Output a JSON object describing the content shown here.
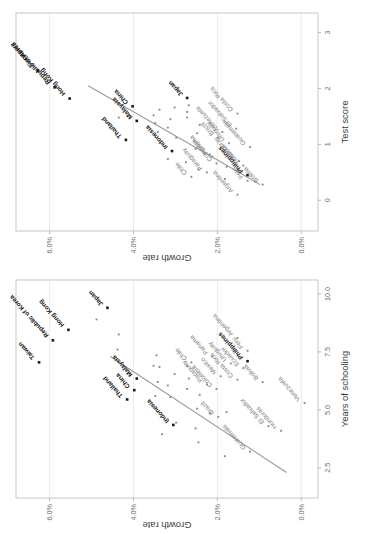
{
  "figure": {
    "orientation": "rotated-90-ccw",
    "panel_count": 2
  },
  "chart_data": [
    {
      "id": "schooling",
      "type": "scatter",
      "title": "",
      "xlabel": "Years of schooling",
      "ylabel": "Growth rate",
      "xlim": [
        1.2,
        10.6
      ],
      "ylim": [
        -0.004,
        0.068
      ],
      "xticks": [
        2.5,
        5.0,
        7.5,
        10.0
      ],
      "xticklabels": [
        "2.5",
        "5.0",
        "7.5",
        "10.0"
      ],
      "yticks": [
        0.0,
        0.02,
        0.04,
        0.06
      ],
      "yticklabels": [
        "0.0%",
        "2.0%",
        "4.0%",
        "6.0%"
      ],
      "grid": true,
      "legend": "none",
      "trendline": {
        "x1": 2.3,
        "y1": 0.0035,
        "x2": 7.3,
        "y2": 0.0455
      },
      "points": [
        {
          "label": "Taiwan",
          "x": 7.05,
          "y": 0.0625,
          "style": "dark",
          "lx": 5,
          "ly": -4
        },
        {
          "label": "Republic of Korea",
          "x": 8.0,
          "y": 0.0592,
          "style": "dark",
          "lx": 5,
          "ly": -4
        },
        {
          "label": "Hong Kong",
          "x": 8.45,
          "y": 0.0555,
          "style": "dark",
          "lx": 5,
          "ly": -4
        },
        {
          "label": "Japan",
          "x": 9.4,
          "y": 0.0462,
          "style": "dark",
          "lx": 4,
          "ly": -4
        },
        {
          "label": "Thailand",
          "x": 5.45,
          "y": 0.0415,
          "style": "dark",
          "lx": 4,
          "ly": -4
        },
        {
          "label": "China",
          "x": 5.85,
          "y": 0.0398,
          "style": "dark",
          "lx": 4,
          "ly": -4
        },
        {
          "label": "Malaysia",
          "x": 6.35,
          "y": 0.0392,
          "style": "dark",
          "lx": 4,
          "ly": -4
        },
        {
          "label": "Indonesia",
          "x": 4.35,
          "y": 0.0305,
          "style": "dark",
          "lx": 4,
          "ly": -4
        },
        {
          "label": "Philippines",
          "x": 7.1,
          "y": 0.0128,
          "style": "dark",
          "lx": 4,
          "ly": -4
        },
        {
          "label": "Chile",
          "x": 7.05,
          "y": 0.0262,
          "style": "grey",
          "lx": 4,
          "ly": -4
        },
        {
          "label": "Panama",
          "x": 7.3,
          "y": 0.0212,
          "style": "grey",
          "lx": 4,
          "ly": -4
        },
        {
          "label": "Paraguay",
          "x": 6.1,
          "y": 0.0225,
          "style": "grey",
          "lx": 4,
          "ly": -4
        },
        {
          "label": "Colombia",
          "x": 5.9,
          "y": 0.0202,
          "style": "grey",
          "lx": 4,
          "ly": -4
        },
        {
          "label": "Mexico",
          "x": 6.45,
          "y": 0.0192,
          "style": "grey",
          "lx": 4,
          "ly": -4
        },
        {
          "label": "Brazil",
          "x": 4.7,
          "y": 0.0198,
          "style": "grey",
          "lx": 4,
          "ly": -4
        },
        {
          "label": "Uruguay",
          "x": 7.0,
          "y": 0.0168,
          "style": "grey",
          "lx": 4,
          "ly": -4
        },
        {
          "label": "Costa Rica",
          "x": 6.3,
          "y": 0.0152,
          "style": "grey",
          "lx": 4,
          "ly": -4
        },
        {
          "label": "Argentina",
          "x": 8.1,
          "y": 0.0152,
          "style": "grey",
          "lx": 4,
          "ly": -4
        },
        {
          "label": "Ecuador",
          "x": 6.8,
          "y": 0.0138,
          "style": "grey",
          "lx": 4,
          "ly": -4
        },
        {
          "label": "Peru",
          "x": 7.55,
          "y": 0.0128,
          "style": "grey",
          "lx": 4,
          "ly": -4
        },
        {
          "label": "Guatemala",
          "x": 3.2,
          "y": 0.0122,
          "style": "grey",
          "lx": 4,
          "ly": -4
        },
        {
          "label": "Bolivia",
          "x": 6.2,
          "y": 0.0092,
          "style": "grey",
          "lx": 4,
          "ly": -4
        },
        {
          "label": "El Salvador",
          "x": 4.3,
          "y": 0.0078,
          "style": "grey",
          "lx": 4,
          "ly": -4
        },
        {
          "label": "Honduras",
          "x": 4.1,
          "y": 0.0048,
          "style": "grey",
          "lx": 4,
          "ly": -4
        },
        {
          "label": "Venezuela",
          "x": 5.3,
          "y": -0.0008,
          "style": "grey",
          "lx": 4,
          "ly": -4
        },
        {
          "label": "",
          "x": 8.9,
          "y": 0.0488,
          "style": "grey"
        },
        {
          "label": "",
          "x": 7.6,
          "y": 0.0438,
          "style": "grey"
        },
        {
          "label": "",
          "x": 8.25,
          "y": 0.0435,
          "style": "grey"
        },
        {
          "label": "",
          "x": 6.9,
          "y": 0.0352,
          "style": "grey"
        },
        {
          "label": "",
          "x": 7.35,
          "y": 0.0345,
          "style": "grey"
        },
        {
          "label": "",
          "x": 6.85,
          "y": 0.0338,
          "style": "grey"
        },
        {
          "label": "",
          "x": 6.2,
          "y": 0.0342,
          "style": "grey"
        },
        {
          "label": "",
          "x": 5.6,
          "y": 0.0348,
          "style": "grey"
        },
        {
          "label": "",
          "x": 5.1,
          "y": 0.0352,
          "style": "grey"
        },
        {
          "label": "",
          "x": 6.05,
          "y": 0.0318,
          "style": "grey"
        },
        {
          "label": "",
          "x": 5.55,
          "y": 0.0312,
          "style": "grey"
        },
        {
          "label": "",
          "x": 6.55,
          "y": 0.0302,
          "style": "grey"
        },
        {
          "label": "",
          "x": 4.6,
          "y": 0.0318,
          "style": "grey"
        },
        {
          "label": "",
          "x": 3.95,
          "y": 0.0332,
          "style": "grey"
        },
        {
          "label": "",
          "x": 6.9,
          "y": 0.0272,
          "style": "grey"
        },
        {
          "label": "",
          "x": 6.35,
          "y": 0.0268,
          "style": "grey"
        },
        {
          "label": "",
          "x": 5.9,
          "y": 0.0272,
          "style": "grey"
        },
        {
          "label": "",
          "x": 4.45,
          "y": 0.0298,
          "style": "grey"
        },
        {
          "label": "",
          "x": 5.05,
          "y": 0.0248,
          "style": "grey"
        },
        {
          "label": "",
          "x": 5.65,
          "y": 0.0242,
          "style": "grey"
        },
        {
          "label": "",
          "x": 4.2,
          "y": 0.0252,
          "style": "grey"
        },
        {
          "label": "",
          "x": 3.6,
          "y": 0.0245,
          "style": "grey"
        },
        {
          "label": "",
          "x": 4.85,
          "y": 0.0218,
          "style": "grey"
        },
        {
          "label": "",
          "x": 4.9,
          "y": 0.0178,
          "style": "grey"
        },
        {
          "label": "",
          "x": 3.0,
          "y": 0.0182,
          "style": "grey"
        }
      ]
    },
    {
      "id": "testscore",
      "type": "scatter",
      "title": "",
      "xlabel": "Test score",
      "ylabel": "Growth rate",
      "xlim": [
        -0.55,
        3.35
      ],
      "ylim": [
        -0.004,
        0.068
      ],
      "xticks": [
        0,
        1,
        2,
        3
      ],
      "xticklabels": [
        "0",
        "1",
        "2",
        "3"
      ],
      "yticks": [
        0.0,
        0.02,
        0.04,
        0.06
      ],
      "yticklabels": [
        "0.0%",
        "2.0%",
        "4.0%",
        "6.0%"
      ],
      "grid": true,
      "legend": "none",
      "trendline": {
        "x1": 0.28,
        "y1": 0.0098,
        "x2": 2.05,
        "y2": 0.0508
      },
      "points": [
        {
          "label": "Singapore",
          "x": 2.32,
          "y": 0.0628,
          "style": "dark",
          "lx": 5,
          "ly": -4
        },
        {
          "label": "Republic of Korea",
          "x": 2.02,
          "y": 0.0588,
          "style": "dark",
          "lx": 5,
          "ly": -4
        },
        {
          "label": "Hong Kong",
          "x": 1.82,
          "y": 0.0552,
          "style": "dark",
          "lx": 5,
          "ly": -4
        },
        {
          "label": "China",
          "x": 1.68,
          "y": 0.0402,
          "style": "dark",
          "lx": 4,
          "ly": -4
        },
        {
          "label": "Thailand",
          "x": 1.08,
          "y": 0.0418,
          "style": "dark",
          "lx": 4,
          "ly": -4
        },
        {
          "label": "Malaysia",
          "x": 1.42,
          "y": 0.0392,
          "style": "dark",
          "lx": 4,
          "ly": -4
        },
        {
          "label": "Japan",
          "x": 1.83,
          "y": 0.0272,
          "style": "dark",
          "lx": 4,
          "ly": -4
        },
        {
          "label": "Indonesia",
          "x": 0.88,
          "y": 0.0308,
          "style": "dark",
          "lx": 4,
          "ly": -4
        },
        {
          "label": "Philippines",
          "x": 0.45,
          "y": 0.0128,
          "style": "dark",
          "lx": 4,
          "ly": -4
        },
        {
          "label": "Uruguay",
          "x": 1.02,
          "y": 0.0172,
          "style": "grey",
          "lx": 4,
          "ly": -4
        },
        {
          "label": "Brazil",
          "x": 1.12,
          "y": 0.0198,
          "style": "grey",
          "lx": 4,
          "ly": -4
        },
        {
          "label": "Venezuela",
          "x": 1.22,
          "y": 0.0188,
          "style": "grey",
          "lx": 4,
          "ly": -4
        },
        {
          "label": "El Salvador",
          "x": 1.28,
          "y": 0.0155,
          "style": "grey",
          "lx": 4,
          "ly": -4
        },
        {
          "label": "Costa Rica",
          "x": 1.55,
          "y": 0.0152,
          "style": "grey",
          "lx": 4,
          "ly": -4
        },
        {
          "label": "Guatemala",
          "x": 0.95,
          "y": 0.0122,
          "style": "grey",
          "lx": 4,
          "ly": -4
        },
        {
          "label": "Panama",
          "x": 0.78,
          "y": 0.0212,
          "style": "grey",
          "lx": 4,
          "ly": -4
        },
        {
          "label": "Ecuador",
          "x": 0.62,
          "y": 0.0138,
          "style": "grey",
          "lx": 4,
          "ly": -4
        },
        {
          "label": "Honduras",
          "x": 0.7,
          "y": 0.0148,
          "style": "grey",
          "lx": 4,
          "ly": -4
        },
        {
          "label": "Colombia",
          "x": 0.66,
          "y": 0.0202,
          "style": "grey",
          "lx": 4,
          "ly": -4
        },
        {
          "label": "Chile",
          "x": 0.42,
          "y": 0.0262,
          "style": "grey",
          "lx": 4,
          "ly": -4
        },
        {
          "label": "Paraguay",
          "x": 0.5,
          "y": 0.0225,
          "style": "grey",
          "lx": 4,
          "ly": -4
        },
        {
          "label": "Argentina",
          "x": 0.1,
          "y": 0.0152,
          "style": "grey",
          "lx": 4,
          "ly": -4
        },
        {
          "label": "Peru",
          "x": 0.35,
          "y": 0.0128,
          "style": "grey",
          "lx": 4,
          "ly": -4
        },
        {
          "label": "Bolivia",
          "x": 0.28,
          "y": 0.0092,
          "style": "grey",
          "lx": 4,
          "ly": -4
        },
        {
          "label": "",
          "x": 1.52,
          "y": 0.0352,
          "style": "grey"
        },
        {
          "label": "",
          "x": 1.38,
          "y": 0.0348,
          "style": "grey"
        },
        {
          "label": "",
          "x": 1.22,
          "y": 0.0342,
          "style": "grey"
        },
        {
          "label": "",
          "x": 1.62,
          "y": 0.0338,
          "style": "grey"
        },
        {
          "label": "",
          "x": 1.3,
          "y": 0.0318,
          "style": "grey"
        },
        {
          "label": "",
          "x": 1.45,
          "y": 0.0312,
          "style": "grey"
        },
        {
          "label": "",
          "x": 1.66,
          "y": 0.0302,
          "style": "grey"
        },
        {
          "label": "",
          "x": 1.0,
          "y": 0.0332,
          "style": "grey"
        },
        {
          "label": "",
          "x": 1.58,
          "y": 0.0272,
          "style": "grey"
        },
        {
          "label": "",
          "x": 1.7,
          "y": 0.0268,
          "style": "grey"
        },
        {
          "label": "",
          "x": 1.48,
          "y": 0.0272,
          "style": "grey"
        },
        {
          "label": "",
          "x": 1.12,
          "y": 0.0298,
          "style": "grey"
        },
        {
          "label": "",
          "x": 0.74,
          "y": 0.0318,
          "style": "grey"
        },
        {
          "label": "",
          "x": 1.2,
          "y": 0.0248,
          "style": "grey"
        },
        {
          "label": "",
          "x": 1.35,
          "y": 0.0242,
          "style": "grey"
        },
        {
          "label": "",
          "x": 0.92,
          "y": 0.0252,
          "style": "grey"
        },
        {
          "label": "",
          "x": 0.55,
          "y": 0.0245,
          "style": "grey"
        },
        {
          "label": "",
          "x": 0.82,
          "y": 0.0218,
          "style": "grey"
        },
        {
          "label": "",
          "x": 0.6,
          "y": 0.0178,
          "style": "grey"
        },
        {
          "label": "",
          "x": 1.9,
          "y": 0.0438,
          "style": "grey"
        },
        {
          "label": "",
          "x": 1.48,
          "y": 0.0435,
          "style": "grey"
        },
        {
          "label": "",
          "x": 0.68,
          "y": 0.0275,
          "style": "grey"
        },
        {
          "label": "",
          "x": 0.38,
          "y": 0.0182,
          "style": "grey"
        }
      ]
    }
  ]
}
